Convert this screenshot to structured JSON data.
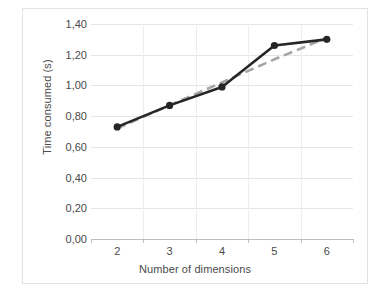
{
  "chart_data": {
    "type": "line",
    "title": "",
    "xlabel": "Number of dimensions",
    "ylabel": "Time consumed (s)",
    "categories": [
      "2",
      "3",
      "4",
      "5",
      "6"
    ],
    "x": [
      2,
      3,
      4,
      5,
      6
    ],
    "series": [
      {
        "name": "Time consumed",
        "values": [
          0.73,
          0.87,
          0.99,
          1.26,
          1.3
        ],
        "style": "solid",
        "color": "#262626",
        "markers": true
      },
      {
        "name": "Linear trendline",
        "values": [
          0.72,
          0.87,
          1.02,
          1.17,
          1.31
        ],
        "style": "dashed",
        "color": "#a6a6a6",
        "markers": false
      }
    ],
    "ylim": [
      0.0,
      1.4
    ],
    "ytick_labels": [
      "0,00",
      "0,20",
      "0,40",
      "0,60",
      "0,80",
      "1,00",
      "1,20",
      "1,40"
    ],
    "ytick_values": [
      0.0,
      0.2,
      0.4,
      0.6,
      0.8,
      1.0,
      1.2,
      1.4
    ],
    "grid": "horizontal-and-vertical",
    "legend": "none",
    "decimal_separator": ","
  },
  "colors": {
    "series": "#262626",
    "trendline": "#a6a6a6",
    "gridline": "#e6e6e6",
    "axis": "#bfbfbf",
    "text": "#4a4a4a",
    "frame": "#e2e2e2",
    "background": "#ffffff"
  }
}
